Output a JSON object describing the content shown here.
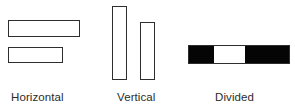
{
  "figure": {
    "width": 295,
    "height": 112,
    "background": "#ffffff",
    "outline_color": "#2e2e2e",
    "fill_color": "#050505",
    "empty_color": "#ffffff",
    "text_color": "#2b2b2b"
  },
  "groups": [
    {
      "id": "horizontal",
      "caption": "Horizontal",
      "caption_x": 11,
      "caption_y": 90,
      "bars": [
        {
          "name": "horizontal-bar-top",
          "x": 8,
          "y": 20,
          "w": 72,
          "h": 17,
          "style": "outline"
        },
        {
          "name": "horizontal-bar-bottom",
          "x": 8,
          "y": 47,
          "w": 55,
          "h": 16,
          "style": "outline"
        }
      ]
    },
    {
      "id": "vertical",
      "caption": "Vertical",
      "caption_x": 117,
      "caption_y": 90,
      "bars": [
        {
          "name": "vertical-bar-left",
          "x": 112,
          "y": 6,
          "w": 15,
          "h": 74,
          "style": "outline"
        },
        {
          "name": "vertical-bar-right",
          "x": 140,
          "y": 22,
          "w": 15,
          "h": 58,
          "style": "outline"
        }
      ]
    },
    {
      "id": "divided",
      "caption": "Divided",
      "caption_x": 215,
      "caption_y": 90,
      "divided_bar": {
        "name": "divided-bar",
        "x": 188,
        "y": 45,
        "w": 102,
        "h": 19,
        "segments": [
          {
            "name": "divided-segment-left",
            "state": "filled",
            "width_pct": 25
          },
          {
            "name": "divided-segment-middle",
            "state": "empty",
            "width_pct": 31
          },
          {
            "name": "divided-segment-right",
            "state": "filled",
            "width_pct": 44
          }
        ]
      }
    }
  ]
}
